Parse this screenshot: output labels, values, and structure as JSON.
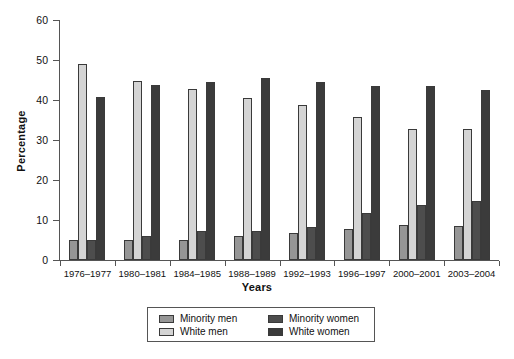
{
  "chart_data": {
    "type": "bar",
    "title": "",
    "xlabel": "Years",
    "ylabel": "Percentage",
    "ylim": [
      0,
      60
    ],
    "yticks": [
      0,
      10,
      20,
      30,
      40,
      50,
      60
    ],
    "grid": false,
    "legend_position": "bottom-center",
    "categories": [
      "1976–1977",
      "1980–1981",
      "1984–1985",
      "1988–1989",
      "1992–1993",
      "1996–1997",
      "2000–2001",
      "2003–2004"
    ],
    "series": [
      {
        "name": "Minority men",
        "color": "#969696",
        "values": [
          5.0,
          5.1,
          5.0,
          6.0,
          6.8,
          7.8,
          8.7,
          8.6
        ]
      },
      {
        "name": "White men",
        "color": "#d4d4d4",
        "values": [
          49.0,
          44.7,
          42.8,
          40.6,
          38.7,
          35.7,
          32.8,
          32.8
        ]
      },
      {
        "name": "Minority women",
        "color": "#4d4d4d",
        "values": [
          5.0,
          6.1,
          7.2,
          7.2,
          8.2,
          11.8,
          13.7,
          14.7
        ]
      },
      {
        "name": "White women",
        "color": "#3b3b3b",
        "values": [
          40.8,
          43.8,
          44.6,
          45.6,
          44.5,
          43.6,
          43.6,
          42.5
        ]
      }
    ]
  },
  "axis": {
    "ylabel": "Percentage",
    "xlabel": "Years"
  }
}
